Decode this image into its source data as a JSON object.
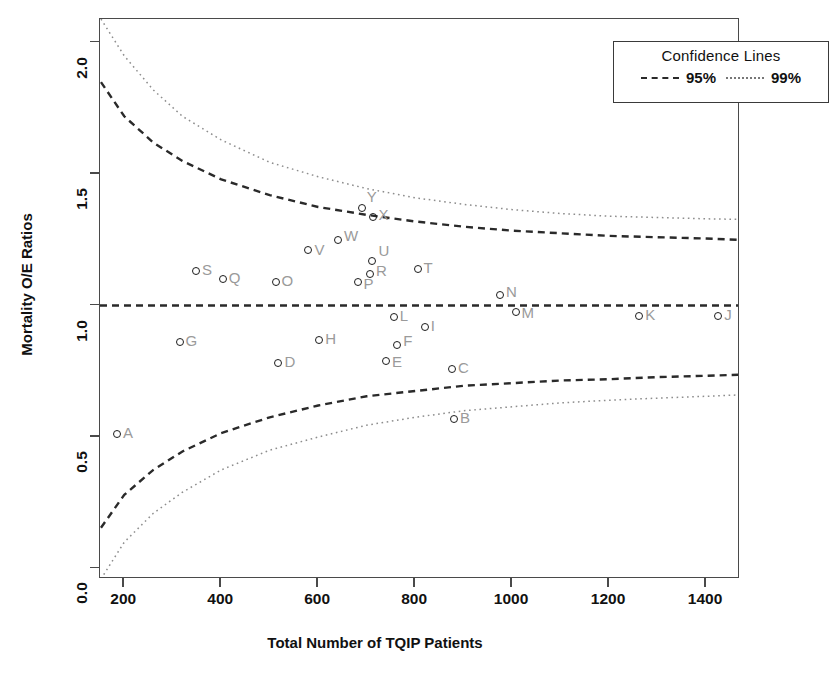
{
  "chart_data": {
    "type": "scatter",
    "title": "",
    "xlabel": "Total Number of TQIP Patients",
    "ylabel": "Mortality O/E Ratios",
    "xlim": [
      150,
      1470
    ],
    "ylim": [
      -0.04,
      2.09
    ],
    "xticks": [
      200,
      400,
      600,
      800,
      1000,
      1200,
      1400
    ],
    "yticks": [
      "0.0",
      "0.5",
      "1.0",
      "1.5",
      "2.0"
    ],
    "grid": false,
    "legend_position": "top-right",
    "target_line": 1.0,
    "points": [
      {
        "label": "A",
        "x": 185,
        "y": 0.51
      },
      {
        "label": "B",
        "x": 880,
        "y": 0.57
      },
      {
        "label": "C",
        "x": 876,
        "y": 0.76
      },
      {
        "label": "D",
        "x": 518,
        "y": 0.78
      },
      {
        "label": "E",
        "x": 740,
        "y": 0.79
      },
      {
        "label": "F",
        "x": 763,
        "y": 0.85
      },
      {
        "label": "G",
        "x": 314,
        "y": 0.86
      },
      {
        "label": "H",
        "x": 602,
        "y": 0.87
      },
      {
        "label": "I",
        "x": 820,
        "y": 0.92
      },
      {
        "label": "J",
        "x": 1425,
        "y": 0.96
      },
      {
        "label": "K",
        "x": 1262,
        "y": 0.96
      },
      {
        "label": "L",
        "x": 756,
        "y": 0.955
      },
      {
        "label": "M",
        "x": 1007,
        "y": 0.975
      },
      {
        "label": "N",
        "x": 975,
        "y": 1.04
      },
      {
        "label": "O",
        "x": 512,
        "y": 1.09
      },
      {
        "label": "P",
        "x": 683,
        "y": 1.09
      },
      {
        "label": "Q",
        "x": 403,
        "y": 1.1
      },
      {
        "label": "R",
        "x": 707,
        "y": 1.12
      },
      {
        "label": "S",
        "x": 348,
        "y": 1.13
      },
      {
        "label": "T",
        "x": 805,
        "y": 1.14
      },
      {
        "label": "U",
        "x": 712,
        "y": 1.17
      },
      {
        "label": "V",
        "x": 580,
        "y": 1.21
      },
      {
        "label": "W",
        "x": 641,
        "y": 1.25
      },
      {
        "label": "X",
        "x": 714,
        "y": 1.335
      },
      {
        "label": "Y",
        "x": 690,
        "y": 1.37
      }
    ],
    "confidence_bands": [
      {
        "name": "95%",
        "style": "dashed",
        "upper": [
          [
            152,
            1.85
          ],
          [
            200,
            1.72
          ],
          [
            260,
            1.62
          ],
          [
            320,
            1.55
          ],
          [
            400,
            1.48
          ],
          [
            500,
            1.42
          ],
          [
            600,
            1.375
          ],
          [
            700,
            1.345
          ],
          [
            800,
            1.32
          ],
          [
            900,
            1.3
          ],
          [
            1000,
            1.285
          ],
          [
            1100,
            1.275
          ],
          [
            1200,
            1.265
          ],
          [
            1300,
            1.26
          ],
          [
            1400,
            1.255
          ],
          [
            1467,
            1.25
          ]
        ],
        "lower": [
          [
            152,
            0.155
          ],
          [
            200,
            0.28
          ],
          [
            260,
            0.375
          ],
          [
            320,
            0.445
          ],
          [
            400,
            0.515
          ],
          [
            500,
            0.575
          ],
          [
            600,
            0.62
          ],
          [
            700,
            0.655
          ],
          [
            800,
            0.675
          ],
          [
            900,
            0.695
          ],
          [
            1000,
            0.705
          ],
          [
            1100,
            0.715
          ],
          [
            1200,
            0.72
          ],
          [
            1300,
            0.728
          ],
          [
            1400,
            0.733
          ],
          [
            1467,
            0.737
          ]
        ]
      },
      {
        "name": "99%",
        "style": "dotted",
        "upper": [
          [
            152,
            2.09
          ],
          [
            200,
            1.95
          ],
          [
            260,
            1.82
          ],
          [
            320,
            1.72
          ],
          [
            400,
            1.63
          ],
          [
            500,
            1.545
          ],
          [
            600,
            1.49
          ],
          [
            700,
            1.445
          ],
          [
            800,
            1.41
          ],
          [
            900,
            1.385
          ],
          [
            1000,
            1.365
          ],
          [
            1100,
            1.35
          ],
          [
            1200,
            1.34
          ],
          [
            1300,
            1.335
          ],
          [
            1400,
            1.33
          ],
          [
            1467,
            1.328
          ]
        ],
        "lower": [
          [
            152,
            -0.04
          ],
          [
            200,
            0.1
          ],
          [
            260,
            0.21
          ],
          [
            320,
            0.29
          ],
          [
            400,
            0.375
          ],
          [
            500,
            0.45
          ],
          [
            600,
            0.5
          ],
          [
            700,
            0.545
          ],
          [
            800,
            0.575
          ],
          [
            900,
            0.6
          ],
          [
            1000,
            0.615
          ],
          [
            1100,
            0.63
          ],
          [
            1200,
            0.64
          ],
          [
            1300,
            0.648
          ],
          [
            1400,
            0.655
          ],
          [
            1467,
            0.66
          ]
        ]
      }
    ]
  },
  "legend": {
    "title": "Confidence Lines",
    "entries": [
      {
        "label": "95%",
        "style": "dashed"
      },
      {
        "label": "99%",
        "style": "dotted"
      }
    ]
  },
  "colors": {
    "axis": "#4a4a4a",
    "point_stroke": "#1c1c1c",
    "point_label": "#9a9a9a",
    "band_95": "#2a2a2a",
    "band_99": "#8d8d8d",
    "target_line": "#2a2a2a"
  }
}
